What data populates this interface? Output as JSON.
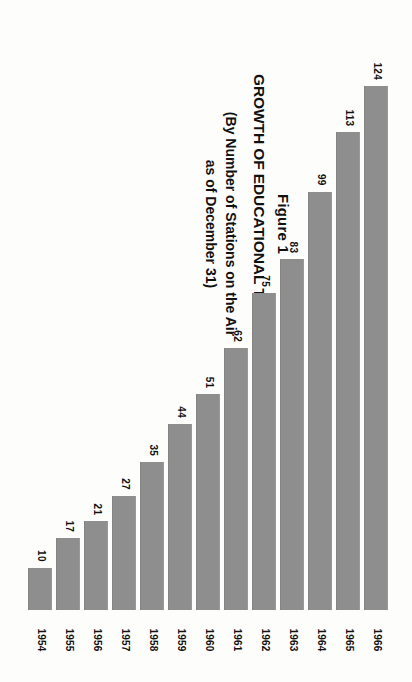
{
  "figure": {
    "figure_label": "Figure 1",
    "title": "GROWTH OF EDUCATIONAL TELEVISION STATIONS",
    "subtitle_line1": "(By Number of Stations on the Air",
    "subtitle_line2": "as of December 31)"
  },
  "colors": {
    "bar": "#8e8e8e",
    "background": "#fdfdfc",
    "text": "#111111"
  },
  "chart_data": {
    "type": "bar",
    "title": "GROWTH OF EDUCATIONAL TELEVISION STATIONS",
    "subtitle": "(By Number of Stations on the Air as of December 31)",
    "xlabel": "",
    "ylabel": "Number of Stations on the Air",
    "ylim": [
      0,
      124
    ],
    "grid": false,
    "legend": false,
    "orientation": "vertical",
    "categories": [
      "1954",
      "1955",
      "1956",
      "1957",
      "1958",
      "1959",
      "1960",
      "1961",
      "1962",
      "1963",
      "1964",
      "1965",
      "1966"
    ],
    "values": [
      10,
      17,
      21,
      27,
      35,
      44,
      51,
      62,
      75,
      83,
      99,
      113,
      124
    ],
    "bars": [
      {
        "year": "1966",
        "value": 124,
        "value_label": "124"
      },
      {
        "year": "1965",
        "value": 113,
        "value_label": "113"
      },
      {
        "year": "1964",
        "value": 99,
        "value_label": "99"
      },
      {
        "year": "1963",
        "value": 83,
        "value_label": "83"
      },
      {
        "year": "1962",
        "value": 75,
        "value_label": "75"
      },
      {
        "year": "1961",
        "value": 62,
        "value_label": "62"
      },
      {
        "year": "1960",
        "value": 51,
        "value_label": "51"
      },
      {
        "year": "1959",
        "value": 44,
        "value_label": "44"
      },
      {
        "year": "1958",
        "value": 35,
        "value_label": "35"
      },
      {
        "year": "1957",
        "value": 27,
        "value_label": "27"
      },
      {
        "year": "1956",
        "value": 21,
        "value_label": "21"
      },
      {
        "year": "1955",
        "value": 17,
        "value_label": "17"
      },
      {
        "year": "1954",
        "value": 10,
        "value_label": "10"
      }
    ]
  }
}
